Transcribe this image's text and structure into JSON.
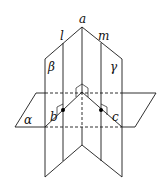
{
  "diagram": {
    "type": "geometry-planes",
    "planes": {
      "alpha": "α",
      "beta": "β",
      "gamma": "γ"
    },
    "lines": {
      "a": "a",
      "l": "l",
      "m": "m"
    },
    "points": {
      "b": "b",
      "c": "c"
    },
    "colors": {
      "stroke": "#1a1a1a",
      "background": "#ffffff"
    }
  }
}
